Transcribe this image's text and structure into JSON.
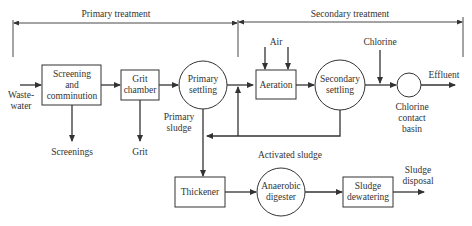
{
  "diagram": {
    "sections": {
      "primary": "Primary treatment",
      "secondary": "Secondary treatment"
    },
    "nodes": {
      "wastewater": [
        "Waste-",
        "water"
      ],
      "screening": [
        "Screening",
        "and",
        "comminution"
      ],
      "grit_chamber": [
        "Grit",
        "chamber"
      ],
      "primary_settling": [
        "Primary",
        "settling"
      ],
      "aeration": "Aeration",
      "secondary_settling": [
        "Secondary",
        "settling"
      ],
      "chlorine_basin": [
        "Chlorine",
        "contact",
        "basin"
      ],
      "thickener": "Thickener",
      "anaerobic_digester": [
        "Anaerobic",
        "digester"
      ],
      "sludge_dewatering": [
        "Sludge",
        "dewatering"
      ]
    },
    "labels": {
      "air": "Air",
      "chlorine": "Chlorine",
      "effluent": "Effluent",
      "screenings": "Screenings",
      "grit": "Grit",
      "primary_sludge": [
        "Primary",
        "sludge"
      ],
      "activated_sludge": "Activated sludge",
      "sludge_disposal": [
        "Sludge",
        "disposal"
      ]
    },
    "colors": {
      "stroke": "#333333",
      "text": "#333333",
      "background": "#ffffff"
    }
  }
}
